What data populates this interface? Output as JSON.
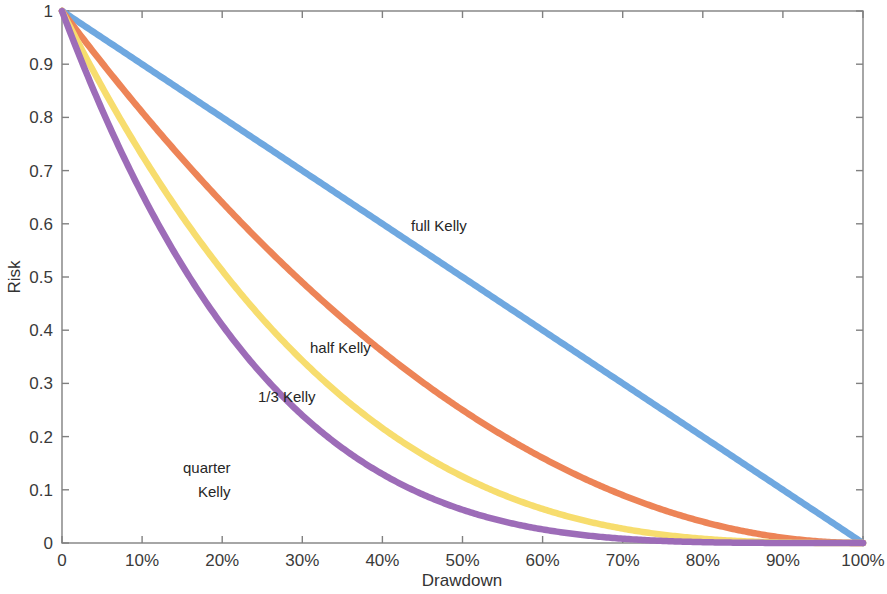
{
  "chart_data": {
    "type": "line",
    "title": "",
    "xlabel": "Drawdown",
    "ylabel": "Risk",
    "xlim": [
      0,
      100
    ],
    "ylim": [
      0,
      1
    ],
    "grid": false,
    "legend_position": "inline-annotations",
    "x_tick_labels": [
      "0",
      "10%",
      "20%",
      "30%",
      "40%",
      "50%",
      "60%",
      "70%",
      "80%",
      "90%",
      "100%"
    ],
    "x_tick_values": [
      0,
      10,
      20,
      30,
      40,
      50,
      60,
      70,
      80,
      90,
      100
    ],
    "y_tick_labels": [
      "0",
      "0.1",
      "0.2",
      "0.3",
      "0.4",
      "0.5",
      "0.6",
      "0.7",
      "0.8",
      "0.9",
      "1"
    ],
    "y_tick_values": [
      0,
      0.1,
      0.2,
      0.3,
      0.4,
      0.5,
      0.6,
      0.7,
      0.8,
      0.9,
      1
    ],
    "x": [
      0,
      5,
      10,
      15,
      20,
      25,
      30,
      35,
      40,
      45,
      50,
      55,
      60,
      65,
      70,
      75,
      80,
      85,
      90,
      95,
      100
    ],
    "series": [
      {
        "name": "full Kelly",
        "color": "#6fa8e0",
        "exponent": 1,
        "label_x": 45,
        "label_y": 0.6,
        "values": [
          1.0,
          0.95,
          0.9,
          0.85,
          0.8,
          0.75,
          0.7,
          0.65,
          0.6,
          0.55,
          0.5,
          0.45,
          0.4,
          0.35,
          0.3,
          0.25,
          0.2,
          0.15,
          0.1,
          0.05,
          0.0
        ]
      },
      {
        "name": "half Kelly",
        "color": "#ed8457",
        "exponent": 2,
        "label_x": 33,
        "label_y": 0.375,
        "values": [
          1.0,
          0.9025,
          0.81,
          0.7225,
          0.64,
          0.5625,
          0.49,
          0.4225,
          0.36,
          0.3025,
          0.25,
          0.2025,
          0.16,
          0.1225,
          0.09,
          0.0625,
          0.04,
          0.0225,
          0.01,
          0.0025,
          0.0
        ]
      },
      {
        "name": "1/3 Kelly",
        "color": "#f7dd6e",
        "exponent": 3,
        "label_x": 27,
        "label_y": 0.27,
        "values": [
          1.0,
          0.857375,
          0.729,
          0.614125,
          0.512,
          0.421875,
          0.343,
          0.274625,
          0.216,
          0.166375,
          0.125,
          0.091125,
          0.064,
          0.042875,
          0.027,
          0.015625,
          0.008,
          0.003375,
          0.001,
          0.000125,
          0.0
        ]
      },
      {
        "name": "quarter Kelly",
        "color": "#9d6cb8",
        "exponent": 4,
        "label_x": 16,
        "label_y": 0.115,
        "values": [
          1.0,
          0.81450625,
          0.6561,
          0.52200625,
          0.4096,
          0.31640625,
          0.2401,
          0.17850625,
          0.1296,
          0.09150625,
          0.0625,
          0.04100625,
          0.0256,
          0.01500625,
          0.0081,
          0.00390625,
          0.0016,
          0.00050625,
          0.0001,
          6.25e-06,
          0.0
        ]
      }
    ],
    "annotations": [
      {
        "text": "full Kelly",
        "x": 411,
        "y": 231
      },
      {
        "text": "half Kelly",
        "x": 310,
        "y": 353
      },
      {
        "text": "1/3 Kelly",
        "x": 258,
        "y": 402
      },
      {
        "text": "quarter",
        "x": 183,
        "y": 473
      },
      {
        "text": "Kelly",
        "x": 198,
        "y": 497
      }
    ]
  },
  "plot_area": {
    "left": 62,
    "top": 11,
    "right": 863,
    "bottom": 543
  }
}
